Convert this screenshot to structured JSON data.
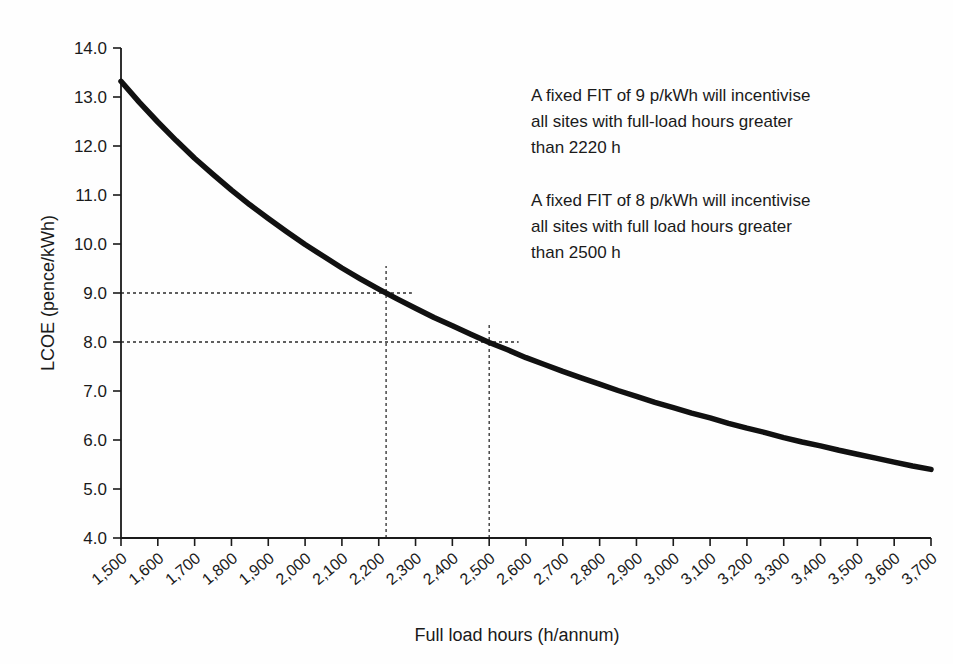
{
  "style": {
    "background": "#fefefe",
    "ink": "#1a1a1a",
    "curve_color": "#111111",
    "dash_color": "#2b2b2b"
  },
  "chart_data": {
    "type": "line",
    "title": "",
    "xlabel": "Full load hours (h/annum)",
    "ylabel": "LCOE (pence/kWh)",
    "xlim": [
      1500,
      3700
    ],
    "ylim": [
      4.0,
      14.0
    ],
    "grid": false,
    "legend": "none",
    "x_ticks": {
      "values": [
        1500,
        1600,
        1700,
        1800,
        1900,
        2000,
        2100,
        2200,
        2300,
        2400,
        2500,
        2600,
        2700,
        2800,
        2900,
        3000,
        3100,
        3200,
        3300,
        3400,
        3500,
        3600,
        3700
      ],
      "labels": [
        "1,500",
        "1,600",
        "1,700",
        "1,800",
        "1,900",
        "2,000",
        "2,100",
        "2,200",
        "2,300",
        "2,400",
        "2,500",
        "2,600",
        "2,700",
        "2,800",
        "2,900",
        "3,000",
        "3,100",
        "3,200",
        "3,300",
        "3,400",
        "3,500",
        "3,600",
        "3,700"
      ]
    },
    "y_ticks": {
      "values": [
        4,
        5,
        6,
        7,
        8,
        9,
        10,
        11,
        12,
        13,
        14
      ],
      "labels": [
        "4.0",
        "5.0",
        "6.0",
        "7.0",
        "8.0",
        "9.0",
        "10.0",
        "11.0",
        "12.0",
        "13.0",
        "14.0"
      ]
    },
    "series": [
      {
        "name": "LCOE vs full load hours",
        "x": [
          1500,
          1550,
          1600,
          1650,
          1700,
          1750,
          1800,
          1850,
          1900,
          1950,
          2000,
          2050,
          2100,
          2150,
          2200,
          2250,
          2300,
          2350,
          2400,
          2450,
          2500,
          2550,
          2600,
          2650,
          2700,
          2750,
          2800,
          2850,
          2900,
          2950,
          3000,
          3050,
          3100,
          3150,
          3200,
          3250,
          3300,
          3350,
          3400,
          3450,
          3500,
          3550,
          3600,
          3650,
          3700
        ],
        "y": [
          13.32,
          12.89,
          12.49,
          12.11,
          11.75,
          11.42,
          11.1,
          10.8,
          10.52,
          10.25,
          9.99,
          9.75,
          9.51,
          9.29,
          9.08,
          8.88,
          8.69,
          8.5,
          8.33,
          8.16,
          7.99,
          7.84,
          7.68,
          7.54,
          7.4,
          7.27,
          7.14,
          7.01,
          6.89,
          6.77,
          6.66,
          6.55,
          6.45,
          6.34,
          6.24,
          6.15,
          6.05,
          5.96,
          5.88,
          5.79,
          5.71,
          5.63,
          5.55,
          5.47,
          5.4
        ]
      }
    ],
    "guides": [
      {
        "name": "fit9-horizontal-guide",
        "type": "h",
        "y": 9.0,
        "x_from": 1500,
        "x_to": 2290
      },
      {
        "name": "fit9-vertical-guide",
        "type": "v",
        "x": 2220,
        "y_from": 4.0,
        "y_to": 9.55
      },
      {
        "name": "fit8-horizontal-guide",
        "type": "h",
        "y": 8.0,
        "x_from": 1500,
        "x_to": 2580
      },
      {
        "name": "fit8-vertical-guide",
        "type": "v",
        "x": 2500,
        "y_from": 4.0,
        "y_to": 8.35
      }
    ],
    "key_points": [
      {
        "x": 2220,
        "y": 9.0
      },
      {
        "x": 2500,
        "y": 8.0
      }
    ]
  },
  "annotations": [
    {
      "lines": [
        "A fixed FIT of 9 p/kWh will incentivise",
        "all sites with full-load hours greater",
        "than 2220 h"
      ]
    },
    {
      "lines": [
        "A fixed FIT of 8 p/kWh will incentivise",
        "all sites with full load hours greater",
        "than 2500 h"
      ]
    }
  ]
}
